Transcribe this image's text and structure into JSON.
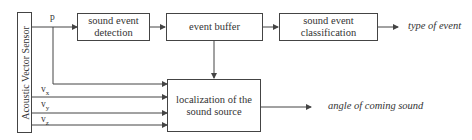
{
  "diagram": {
    "sensor": {
      "label": "Acoustic Vector Sensor"
    },
    "signals": {
      "p": "p",
      "vx": "v",
      "vx_sub": "x",
      "vy": "v",
      "vy_sub": "y",
      "vz": "v",
      "vz_sub": "z"
    },
    "blocks": {
      "detection": {
        "line1": "sound event",
        "line2": "detection"
      },
      "buffer": {
        "label": "event buffer"
      },
      "classification": {
        "line1": "sound event",
        "line2": "classification"
      },
      "localization": {
        "line1": "localization of the",
        "line2": "sound source"
      }
    },
    "outputs": {
      "type": "type of event",
      "angle": "angle of coming sound"
    }
  }
}
